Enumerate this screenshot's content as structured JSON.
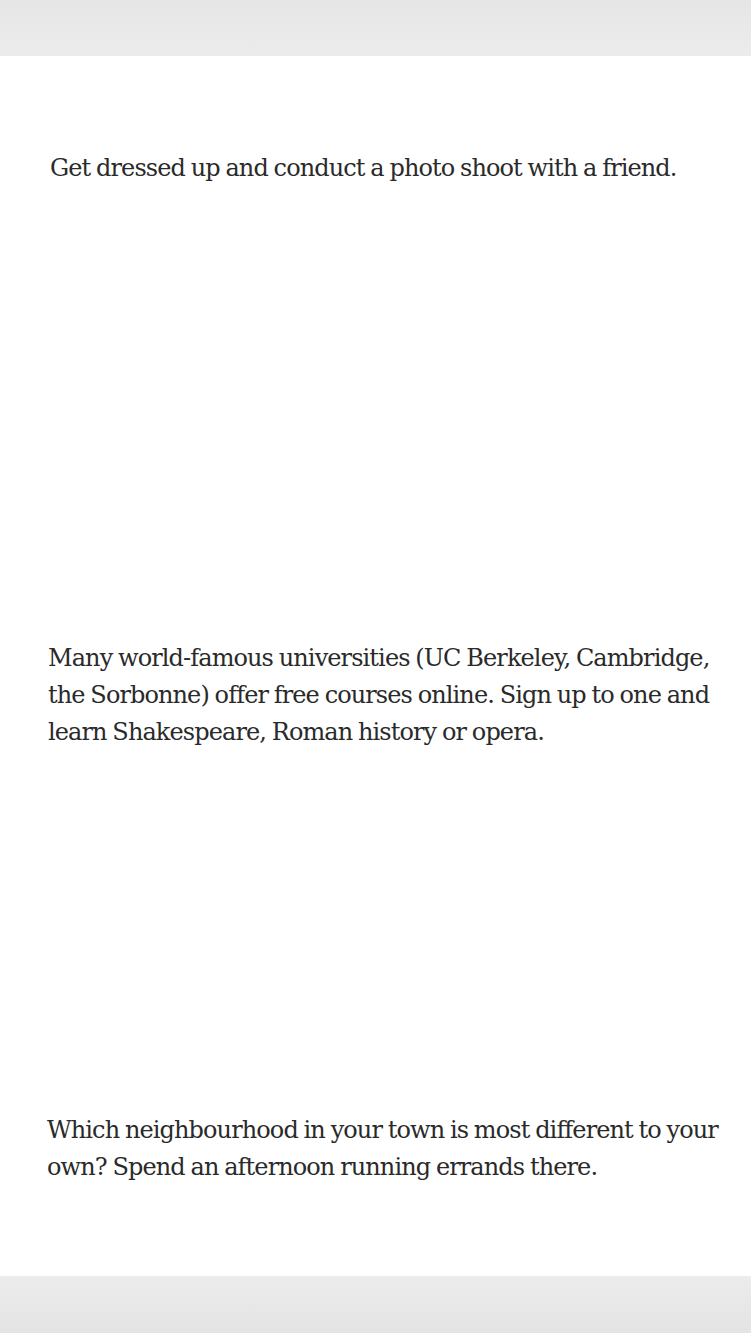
{
  "document": {
    "paragraphs": [
      {
        "text": "Get dressed up and conduct a photo shoot with a friend."
      },
      {
        "text": "Many world-famous universities (UC Berkeley, Cambridge, the Sorbonne) offer free courses online. Sign up to one and learn Shakespeare, Roman history or opera."
      },
      {
        "text": "Which neighbourhood in your town is most different to your own? Spend an afternoon running errands there."
      }
    ]
  },
  "colors": {
    "text": "#2a2a2a",
    "page": "#ffffff",
    "background": "#ebebeb"
  }
}
